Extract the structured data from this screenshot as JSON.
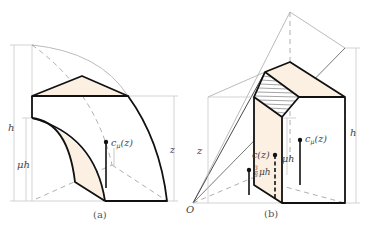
{
  "figure": {
    "panel_a": {
      "caption": "(a)",
      "label_h": "h",
      "label_mu_h": "μh",
      "label_z": "z",
      "label_c_mu": "c",
      "label_c_mu_sub": "μ",
      "label_c_mu_arg": "(z)"
    },
    "panel_b": {
      "caption": "(b)",
      "label_origin": "O",
      "label_z": "z",
      "label_h": "h",
      "label_mu_h": "μh",
      "label_c_mu": "c",
      "label_c_mu_sub": "μ",
      "label_c_mu_arg": "(z)",
      "label_c_z": "c(z)",
      "label_frac_num": "3",
      "label_frac_den": "8",
      "label_frac_mu_h": "μh"
    }
  },
  "colors": {
    "stroke": "#111111",
    "fill_shade": "#fbf0e2",
    "guide": "#bdbdbd",
    "dash": "#9a9a9a"
  }
}
